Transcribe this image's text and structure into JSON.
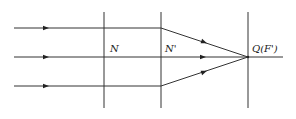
{
  "diagram": {
    "type": "optics-ray-diagram",
    "labels": {
      "plane_n": "N",
      "plane_n_prime": "N'",
      "focal_point": "Q(F')"
    },
    "rays": [
      {
        "name": "top-ray",
        "y": 28
      },
      {
        "name": "middle-ray",
        "y": 57
      },
      {
        "name": "bottom-ray",
        "y": 86
      }
    ],
    "planes": [
      {
        "name": "plane-n",
        "x": 104
      },
      {
        "name": "plane-n-prime",
        "x": 161
      },
      {
        "name": "focal-plane",
        "x": 248
      }
    ],
    "focal_point": {
      "x": 248,
      "y": 57
    },
    "colors": {
      "line": "#333333",
      "background": "#ffffff"
    }
  }
}
